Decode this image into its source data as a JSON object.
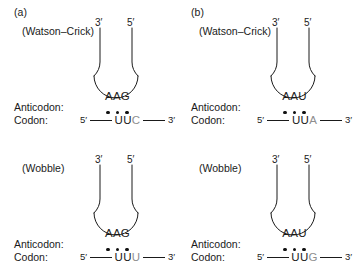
{
  "figure": {
    "line_color": "#1a1a1a",
    "dot_color": "#111111",
    "faint_base_color": "#8e8e8e",
    "background": "#ffffff"
  },
  "labels": {
    "anticodon_row": "Anticodon:",
    "codon_row": "Codon:",
    "five_prime": "5′",
    "three_prime": "3′",
    "dot_symbol": "●"
  },
  "panels": [
    {
      "id": "a",
      "letter": "(a)",
      "pairing_type": "(Watson–Crick)",
      "trna_left_end": "3′",
      "trna_right_end": "5′",
      "anticodon": "AAG",
      "anticodon_bases": [
        "A",
        "A",
        "G"
      ],
      "codon_five_prime": "5′",
      "codon_three_prime": "3′",
      "codon": "UUC",
      "codon_bases": [
        {
          "base": "U",
          "faint": false
        },
        {
          "base": "U",
          "faint": false
        },
        {
          "base": "C",
          "faint": true
        }
      ],
      "bond_count": 3
    },
    {
      "id": "b",
      "letter": "(b)",
      "pairing_type": "(Watson–Crick)",
      "trna_left_end": "3′",
      "trna_right_end": "5′",
      "anticodon": "AAU",
      "anticodon_bases": [
        "A",
        "A",
        "U"
      ],
      "codon_five_prime": "5′",
      "codon_three_prime": "3′",
      "codon": "UUA",
      "codon_bases": [
        {
          "base": "U",
          "faint": false
        },
        {
          "base": "U",
          "faint": false
        },
        {
          "base": "A",
          "faint": true
        }
      ],
      "bond_count": 3
    },
    {
      "id": "c",
      "letter": "",
      "pairing_type": "(Wobble)",
      "trna_left_end": "3′",
      "trna_right_end": "5′",
      "anticodon": "AAG",
      "anticodon_bases": [
        "A",
        "A",
        "G"
      ],
      "codon_five_prime": "5′",
      "codon_three_prime": "3′",
      "codon": "UUU",
      "codon_bases": [
        {
          "base": "U",
          "faint": false
        },
        {
          "base": "U",
          "faint": false
        },
        {
          "base": "U",
          "faint": true
        }
      ],
      "bond_count": 3
    },
    {
      "id": "d",
      "letter": "",
      "pairing_type": "(Wobble)",
      "trna_left_end": "3′",
      "trna_right_end": "5′",
      "anticodon": "AAU",
      "anticodon_bases": [
        "A",
        "A",
        "U"
      ],
      "codon_five_prime": "5′",
      "codon_three_prime": "3′",
      "codon": "UUG",
      "codon_bases": [
        {
          "base": "U",
          "faint": false
        },
        {
          "base": "U",
          "faint": false
        },
        {
          "base": "G",
          "faint": true
        }
      ],
      "bond_count": 3
    }
  ]
}
